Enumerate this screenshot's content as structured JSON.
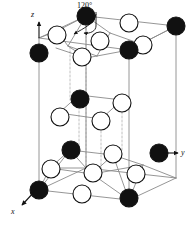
{
  "figure": {
    "kind": "crystal-unit-cell-diagram",
    "background_color": "#ffffff",
    "line_color": "#8a8a8a",
    "dashed_line_color": "#b0b0b0",
    "atom_outline_color": "#111111"
  },
  "annotations": {
    "angle_label": "120°",
    "angle_leader_from": [
      96,
      14
    ],
    "angle_leader_to": [
      74,
      34
    ]
  },
  "axes": [
    {
      "name": "z-axis",
      "label": "z",
      "direction": "up",
      "label_x": 31,
      "label_y": 11,
      "from": [
        39,
        38
      ],
      "to": [
        39,
        22
      ]
    },
    {
      "name": "y-axis",
      "label": "y",
      "direction": "right",
      "label_x": 181,
      "label_y": 149,
      "from": [
        163,
        153
      ],
      "to": [
        178,
        153
      ]
    },
    {
      "name": "x-axis",
      "label": "x",
      "direction": "down-left",
      "label_x": 11,
      "label_y": 208,
      "from": [
        36,
        190
      ],
      "to": [
        22,
        205
      ]
    }
  ],
  "atom_types": [
    {
      "name": "filled-atom",
      "fill": "#111111",
      "stroke": "#111111",
      "radius": 9
    },
    {
      "name": "open-atom",
      "fill": "#ffffff",
      "stroke": "#111111",
      "radius": 9
    }
  ],
  "cell_edges": [
    [
      39,
      38,
      39,
      190
    ],
    [
      39,
      38,
      86,
      16
    ],
    [
      86,
      16,
      176,
      26
    ],
    [
      176,
      26,
      129,
      50
    ],
    [
      129,
      50,
      39,
      38
    ],
    [
      39,
      190,
      86,
      168
    ],
    [
      86,
      168,
      176,
      178
    ],
    [
      176,
      178,
      129,
      200
    ],
    [
      129,
      200,
      39,
      190
    ],
    [
      86,
      16,
      86,
      168
    ],
    [
      176,
      26,
      176,
      178
    ],
    [
      129,
      50,
      129,
      200
    ]
  ],
  "bonds_top": [
    [
      86,
      16,
      68,
      46
    ],
    [
      86,
      16,
      110,
      33
    ],
    [
      86,
      16,
      57,
      31
    ],
    [
      57,
      31,
      68,
      46
    ],
    [
      68,
      46,
      97,
      56
    ],
    [
      97,
      56,
      110,
      33
    ],
    [
      110,
      33,
      141,
      44
    ],
    [
      141,
      44,
      129,
      50
    ],
    [
      97,
      56,
      129,
      50
    ],
    [
      57,
      31,
      39,
      38
    ],
    [
      176,
      26,
      141,
      44
    ],
    [
      68,
      46,
      86,
      58
    ],
    [
      97,
      56,
      86,
      58
    ],
    [
      86,
      58,
      56,
      48
    ]
  ],
  "bonds_mid": [
    [
      79,
      95,
      122,
      100
    ],
    [
      79,
      95,
      59,
      113
    ],
    [
      59,
      113,
      101,
      119
    ],
    [
      101,
      119,
      122,
      100
    ]
  ],
  "bonds_bottom": [
    [
      70,
      150,
      113,
      155
    ],
    [
      70,
      150,
      50,
      168
    ],
    [
      50,
      168,
      92,
      174
    ],
    [
      92,
      174,
      113,
      155
    ],
    [
      39,
      190,
      50,
      168
    ],
    [
      50,
      168,
      86,
      168
    ],
    [
      86,
      168,
      92,
      174
    ],
    [
      92,
      174,
      129,
      200
    ],
    [
      113,
      155,
      129,
      200
    ],
    [
      70,
      150,
      39,
      190
    ],
    [
      113,
      155,
      143,
      165
    ],
    [
      143,
      165,
      176,
      178
    ],
    [
      92,
      174,
      143,
      165
    ],
    [
      86,
      168,
      70,
      150
    ],
    [
      129,
      200,
      143,
      165
    ]
  ],
  "dashed_connectors": [
    [
      79,
      95,
      79,
      150
    ],
    [
      101,
      119,
      101,
      170
    ],
    [
      122,
      100,
      122,
      152
    ],
    [
      86,
      16,
      86,
      168
    ],
    [
      70,
      47,
      70,
      100
    ]
  ],
  "atoms": [
    {
      "id": "t1",
      "type": "filled-atom",
      "x": 86,
      "y": 16,
      "layer": "top"
    },
    {
      "id": "t2",
      "type": "open-atom",
      "x": 129,
      "y": 23,
      "layer": "top"
    },
    {
      "id": "t3",
      "type": "filled-atom",
      "x": 176,
      "y": 26,
      "layer": "top"
    },
    {
      "id": "t4",
      "type": "open-atom",
      "x": 57,
      "y": 35,
      "layer": "top"
    },
    {
      "id": "t5",
      "type": "open-atom",
      "x": 100,
      "y": 41,
      "layer": "top"
    },
    {
      "id": "t6",
      "type": "open-atom",
      "x": 143,
      "y": 45,
      "layer": "top"
    },
    {
      "id": "t7",
      "type": "filled-atom",
      "x": 39,
      "y": 53,
      "layer": "top"
    },
    {
      "id": "t8",
      "type": "open-atom",
      "x": 82,
      "y": 57,
      "layer": "top"
    },
    {
      "id": "t9",
      "type": "filled-atom",
      "x": 129,
      "y": 50,
      "layer": "top"
    },
    {
      "id": "m1",
      "type": "filled-atom",
      "x": 80,
      "y": 99,
      "layer": "middle"
    },
    {
      "id": "m2",
      "type": "open-atom",
      "x": 122,
      "y": 103,
      "layer": "middle"
    },
    {
      "id": "m3",
      "type": "open-atom",
      "x": 60,
      "y": 117,
      "layer": "middle"
    },
    {
      "id": "m4",
      "type": "open-atom",
      "x": 101,
      "y": 121,
      "layer": "middle"
    },
    {
      "id": "b1",
      "type": "filled-atom",
      "x": 71,
      "y": 150,
      "layer": "bottom"
    },
    {
      "id": "b2",
      "type": "open-atom",
      "x": 113,
      "y": 154,
      "layer": "bottom"
    },
    {
      "id": "b3",
      "type": "filled-atom",
      "x": 159,
      "y": 153,
      "layer": "bottom"
    },
    {
      "id": "b4",
      "type": "open-atom",
      "x": 51,
      "y": 169,
      "layer": "bottom"
    },
    {
      "id": "b5",
      "type": "open-atom",
      "x": 93,
      "y": 173,
      "layer": "bottom"
    },
    {
      "id": "b6",
      "type": "open-atom",
      "x": 136,
      "y": 174,
      "layer": "bottom"
    },
    {
      "id": "b7",
      "type": "filled-atom",
      "x": 39,
      "y": 190,
      "layer": "bottom"
    },
    {
      "id": "b8",
      "type": "open-atom",
      "x": 82,
      "y": 194,
      "layer": "bottom"
    },
    {
      "id": "b9",
      "type": "filled-atom",
      "x": 129,
      "y": 198,
      "layer": "bottom"
    }
  ]
}
